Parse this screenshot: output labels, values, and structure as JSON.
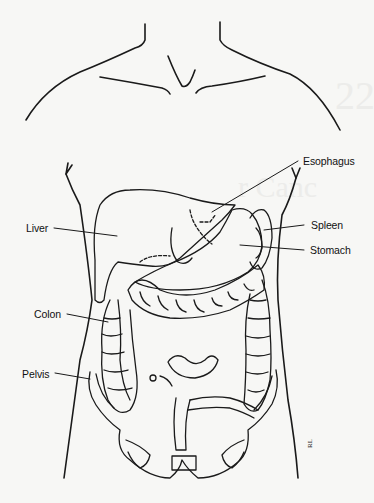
{
  "figure": {
    "labels": {
      "esophagus": "Esophagus",
      "liver": "Liver",
      "spleen": "Spleen",
      "stomach": "Stomach",
      "colon": "Colon",
      "pelvis": "Pelvis"
    },
    "signature": "RL",
    "colors": {
      "line": "#1a1a1a",
      "background": "#f7f7f5"
    }
  }
}
